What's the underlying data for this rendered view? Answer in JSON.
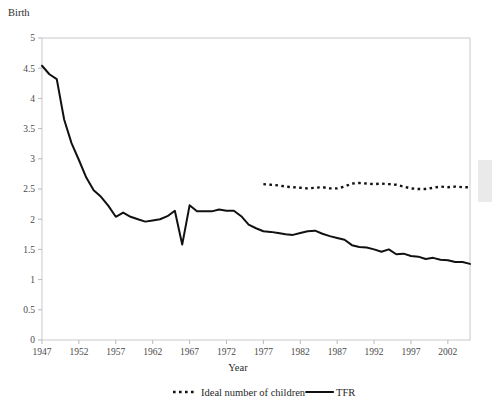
{
  "chart_data": {
    "type": "line",
    "title": "",
    "ylabel": "Birth",
    "xlabel": "Year",
    "ylim": [
      0,
      5
    ],
    "xlim": [
      1947,
      2005
    ],
    "grid": false,
    "legend_position": "bottom",
    "y_ticks": [
      "0",
      "0.5",
      "1",
      "1.5",
      "2",
      "2.5",
      "3",
      "3.5",
      "4",
      "4.5",
      "5"
    ],
    "y_tick_values": [
      0,
      0.5,
      1,
      1.5,
      2,
      2.5,
      3,
      3.5,
      4,
      4.5,
      5
    ],
    "x_ticks": [
      "1947",
      "1952",
      "1957",
      "1962",
      "1967",
      "1972",
      "1977",
      "1982",
      "1987",
      "1992",
      "1997",
      "2002"
    ],
    "x_tick_values": [
      1947,
      1952,
      1957,
      1962,
      1967,
      1972,
      1977,
      1982,
      1987,
      1992,
      1997,
      2002
    ],
    "series": [
      {
        "name": "Ideal number of children",
        "style": "dotted",
        "x": [
          1977,
          1978,
          1979,
          1980,
          1981,
          1982,
          1983,
          1984,
          1985,
          1986,
          1987,
          1988,
          1989,
          1990,
          1991,
          1992,
          1993,
          1994,
          1995,
          1996,
          1997,
          1998,
          1999,
          2000,
          2001,
          2002,
          2003,
          2004,
          2005
        ],
        "values": [
          2.58,
          2.57,
          2.56,
          2.54,
          2.53,
          2.52,
          2.51,
          2.52,
          2.53,
          2.51,
          2.51,
          2.54,
          2.59,
          2.6,
          2.59,
          2.58,
          2.59,
          2.58,
          2.57,
          2.54,
          2.51,
          2.5,
          2.5,
          2.52,
          2.54,
          2.53,
          2.54,
          2.53,
          2.53
        ]
      },
      {
        "name": "TFR",
        "style": "solid",
        "x": [
          1947,
          1948,
          1949,
          1950,
          1951,
          1952,
          1953,
          1954,
          1955,
          1956,
          1957,
          1958,
          1959,
          1960,
          1961,
          1962,
          1963,
          1964,
          1965,
          1966,
          1967,
          1968,
          1969,
          1970,
          1971,
          1972,
          1973,
          1974,
          1975,
          1976,
          1977,
          1978,
          1979,
          1980,
          1981,
          1982,
          1983,
          1984,
          1985,
          1986,
          1987,
          1988,
          1989,
          1990,
          1991,
          1992,
          1993,
          1994,
          1995,
          1996,
          1997,
          1998,
          1999,
          2000,
          2001,
          2002,
          2003,
          2004,
          2005
        ],
        "values": [
          4.54,
          4.4,
          4.32,
          3.65,
          3.26,
          2.98,
          2.69,
          2.48,
          2.37,
          2.22,
          2.04,
          2.11,
          2.04,
          2.0,
          1.96,
          1.98,
          2.0,
          2.05,
          2.14,
          1.58,
          2.23,
          2.13,
          2.13,
          2.13,
          2.16,
          2.14,
          2.14,
          2.05,
          1.91,
          1.85,
          1.8,
          1.79,
          1.77,
          1.75,
          1.74,
          1.77,
          1.8,
          1.81,
          1.76,
          1.72,
          1.69,
          1.66,
          1.57,
          1.54,
          1.53,
          1.5,
          1.46,
          1.5,
          1.42,
          1.43,
          1.39,
          1.38,
          1.34,
          1.36,
          1.33,
          1.32,
          1.29,
          1.29,
          1.26
        ]
      }
    ]
  },
  "legend": {
    "entries": [
      {
        "label": "Ideal number of children",
        "style": "dotted"
      },
      {
        "label": "TFR",
        "style": "solid"
      }
    ]
  },
  "colors": {
    "line": "#111111",
    "frame": "#c9c9c9",
    "text": "#1f1f1f"
  }
}
